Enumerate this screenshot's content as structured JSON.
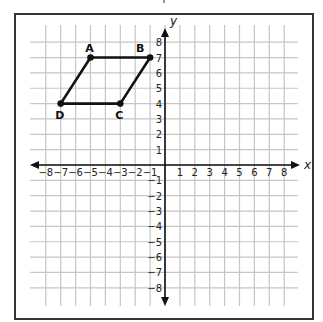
{
  "chart_data": {
    "type": "scatter",
    "title": "",
    "xlabel": "x",
    "ylabel": "y",
    "xlim": [
      -8,
      8
    ],
    "ylim": [
      -8,
      8
    ],
    "grid": true,
    "x_ticks": [
      -8,
      -7,
      -6,
      -5,
      -4,
      -3,
      -2,
      -1,
      1,
      2,
      3,
      4,
      5,
      6,
      7,
      8
    ],
    "y_ticks": [
      -8,
      -7,
      -6,
      -5,
      -4,
      -3,
      -2,
      -1,
      1,
      2,
      3,
      4,
      5,
      6,
      7,
      8
    ],
    "shape": "parallelogram",
    "points": [
      {
        "label": "A",
        "x": -5,
        "y": 7
      },
      {
        "label": "B",
        "x": -1,
        "y": 7
      },
      {
        "label": "C",
        "x": -3,
        "y": 4
      },
      {
        "label": "D",
        "x": -7,
        "y": 4
      }
    ],
    "edges": [
      [
        "A",
        "B"
      ],
      [
        "B",
        "C"
      ],
      [
        "C",
        "D"
      ],
      [
        "D",
        "A"
      ]
    ]
  },
  "colors": {
    "grid": "#c6c6c6",
    "axis": "#111111",
    "shape": "#111111",
    "frame": "#333333"
  },
  "axes": {
    "x_label": "x",
    "y_label": "y"
  }
}
